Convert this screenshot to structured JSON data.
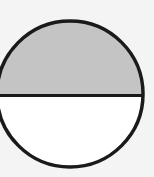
{
  "diagram": {
    "colors": {
      "background": "#f4f4f4",
      "shaded": "#c4c4c4",
      "unshaded": "#ffffff",
      "stroke": "#1a1a1a"
    },
    "circle": {
      "cx": 70,
      "cy": 94,
      "r": 73
    },
    "fraction_shaded": "1/2"
  }
}
